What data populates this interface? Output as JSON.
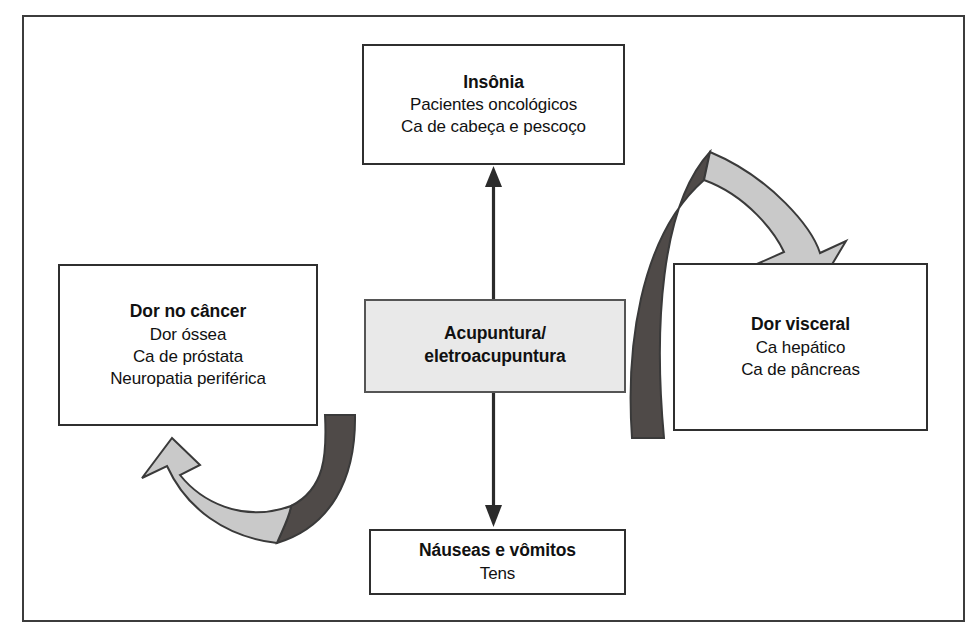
{
  "figure": {
    "frame_color": "#3c3c3c",
    "background": "#ffffff"
  },
  "nodes": {
    "center": {
      "id": "acupuntura",
      "title_line_1": "Acupuntura/",
      "title_line_2": "eletroacupuntura",
      "fill": "#e9e9e9",
      "border": "#555555"
    },
    "top": {
      "id": "insonia",
      "title": "Insônia",
      "lines": [
        "Pacientes oncológicos",
        "Ca de cabeça e pescoço"
      ]
    },
    "left": {
      "id": "dor-no-cancer",
      "title": "Dor no câncer",
      "lines": [
        "Dor óssea",
        "Ca de próstata",
        "Neuropatia periférica"
      ]
    },
    "right": {
      "id": "dor-visceral",
      "title": "Dor visceral",
      "lines": [
        "Ca hepático",
        "Ca de pâncreas"
      ]
    },
    "bottom": {
      "id": "nauseas-e-vomitos",
      "title": "Náuseas e vômitos",
      "lines": [
        "Tens"
      ]
    }
  },
  "connectors": {
    "up_arrow": {
      "name": "arrow-center-to-insomnia",
      "direction": "up",
      "color": "#2b2b2b"
    },
    "down_arrow": {
      "name": "arrow-center-to-nausea",
      "direction": "down",
      "color": "#2b2b2b"
    },
    "top_curved_arrow": {
      "name": "curved-arrow-insomnia-to-visceral",
      "direction": "clockwise",
      "fill_dark": "#4f4a48",
      "fill_light": "#c9c9c9",
      "stroke": "#3a3a3a"
    },
    "bottom_curved_arrow": {
      "name": "curved-arrow-nausea-to-cancer-pain",
      "direction": "counter-clockwise",
      "fill_dark": "#4f4a48",
      "fill_light": "#c9c9c9",
      "stroke": "#3a3a3a"
    }
  }
}
